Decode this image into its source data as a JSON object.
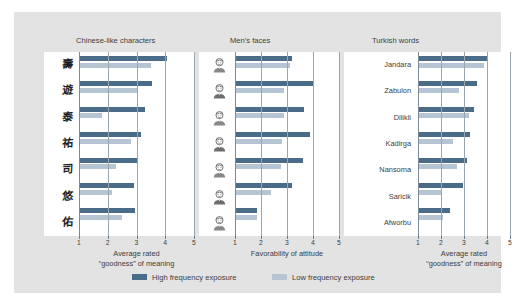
{
  "figure": {
    "background_color": "#e3e3e3",
    "plot_background_color": "#ffffff",
    "colors": {
      "high_frequency": "#4a6c89",
      "low_frequency": "#b6c5d4",
      "gridline": "#9aa6b0",
      "text": "#3d3d3d"
    }
  },
  "legend": {
    "items": [
      {
        "label": "High frequency exposure",
        "color": "#4a6c89",
        "key": "high"
      },
      {
        "label": "Low frequency exposure",
        "color": "#b6c5d4",
        "key": "low"
      }
    ]
  },
  "panels": [
    {
      "title": "Chinese-like characters",
      "axis_title_line1": "Average rated",
      "axis_title_line2": "“goodness” of meaning",
      "category_type": "chinese-glyph",
      "categories": [
        "壽",
        "遊",
        "泰",
        "祐",
        "司",
        "悠",
        "佑"
      ],
      "ticks": [
        1,
        2,
        3,
        4,
        5
      ]
    },
    {
      "title": "Men's faces",
      "axis_title_line1": "Favorability of attitude",
      "axis_title_line2": "",
      "category_type": "face-portrait",
      "categories": [
        "face-1",
        "face-2",
        "face-3",
        "face-4",
        "face-5",
        "face-6",
        "face-7"
      ],
      "ticks": [
        1,
        2,
        3,
        4,
        5
      ]
    },
    {
      "title": "Turkish words",
      "axis_title_line1": "Average rated",
      "axis_title_line2": "“goodness” of meaning",
      "category_type": "word-label",
      "categories": [
        "Jandara",
        "Zabulon",
        "Dilikli",
        "Kadirga",
        "Nansoma",
        "Saricik",
        "Afworbu"
      ],
      "ticks": [
        1,
        2,
        3,
        4,
        5
      ]
    }
  ],
  "chart_data": [
    {
      "type": "bar",
      "orientation": "horizontal",
      "title": "Chinese-like characters",
      "xlabel": "Average rated “goodness” of meaning",
      "ylabel": "",
      "xlim": [
        1,
        5
      ],
      "xticks": [
        1,
        2,
        3,
        4,
        5
      ],
      "grid": true,
      "legend_position": "bottom",
      "categories": [
        "壽",
        "遊",
        "泰",
        "祐",
        "司",
        "悠",
        "佑"
      ],
      "series": [
        {
          "name": "High frequency exposure",
          "color": "#4a6c89",
          "values": [
            4.05,
            3.55,
            3.3,
            3.15,
            3.05,
            2.9,
            2.95
          ]
        },
        {
          "name": "Low frequency exposure",
          "color": "#b6c5d4",
          "values": [
            3.5,
            3.05,
            1.8,
            2.8,
            2.3,
            2.15,
            2.5
          ]
        }
      ]
    },
    {
      "type": "bar",
      "orientation": "horizontal",
      "title": "Men's faces",
      "xlabel": "Favorability of attitude",
      "ylabel": "",
      "xlim": [
        1,
        5
      ],
      "xticks": [
        1,
        2,
        3,
        4,
        5
      ],
      "grid": true,
      "legend_position": "bottom",
      "categories": [
        "face-1",
        "face-2",
        "face-3",
        "face-4",
        "face-5",
        "face-6",
        "face-7"
      ],
      "series": [
        {
          "name": "High frequency exposure",
          "color": "#4a6c89",
          "values": [
            3.2,
            4.0,
            3.65,
            3.9,
            3.6,
            3.2,
            1.85
          ]
        },
        {
          "name": "Low frequency exposure",
          "color": "#b6c5d4",
          "values": [
            3.1,
            2.9,
            2.9,
            2.8,
            2.75,
            2.4,
            1.85
          ]
        }
      ]
    },
    {
      "type": "bar",
      "orientation": "horizontal",
      "title": "Turkish words",
      "xlabel": "Average rated “goodness” of meaning",
      "ylabel": "",
      "xlim": [
        1,
        5
      ],
      "xticks": [
        1,
        2,
        3,
        4,
        5
      ],
      "grid": true,
      "legend_position": "bottom",
      "categories": [
        "Jandara",
        "Zabulon",
        "Dilikli",
        "Kadirga",
        "Nansoma",
        "Saricik",
        "Afworbu"
      ],
      "series": [
        {
          "name": "High frequency exposure",
          "color": "#4a6c89",
          "values": [
            4.05,
            3.55,
            3.45,
            3.25,
            3.15,
            2.95,
            2.4
          ]
        },
        {
          "name": "Low frequency exposure",
          "color": "#b6c5d4",
          "values": [
            3.85,
            2.8,
            3.2,
            2.5,
            2.7,
            2.0,
            2.1
          ]
        }
      ]
    }
  ]
}
